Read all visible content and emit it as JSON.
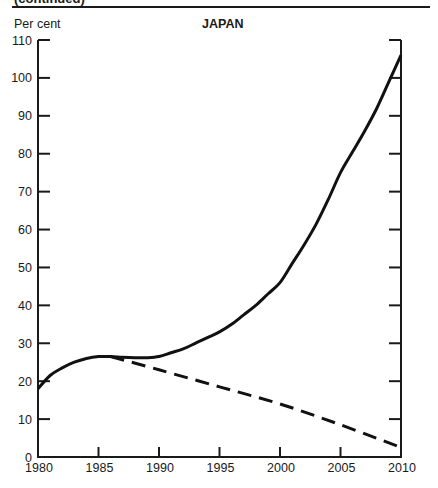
{
  "header": {
    "continued_label": "(continued)",
    "y_unit_label": "Per cent",
    "title": "JAPAN"
  },
  "chart_data": {
    "type": "line",
    "title": "JAPAN",
    "xlabel": "",
    "ylabel": "Per cent",
    "xlim": [
      1980,
      2010
    ],
    "ylim": [
      0,
      110
    ],
    "x_ticks": [
      1980,
      1985,
      1990,
      1995,
      2000,
      2005,
      2010
    ],
    "y_ticks": [
      0,
      10,
      20,
      30,
      40,
      50,
      60,
      70,
      80,
      90,
      100,
      110
    ],
    "grid": false,
    "legend": null,
    "series": [
      {
        "name": "solid",
        "style": "solid",
        "x": [
          1980,
          1981,
          1982,
          1983,
          1984,
          1985,
          1986,
          1987,
          1988,
          1989,
          1990,
          1991,
          1992,
          1993,
          1994,
          1995,
          1996,
          1997,
          1998,
          1999,
          2000,
          2001,
          2002,
          2003,
          2004,
          2005,
          2006,
          2007,
          2008,
          2009,
          2010
        ],
        "values": [
          18,
          21.5,
          23.5,
          25,
          26,
          26.5,
          26.5,
          26.3,
          26.2,
          26.2,
          26.5,
          27.5,
          28.5,
          30,
          31.5,
          33,
          35,
          37.5,
          40,
          43,
          46,
          51,
          56,
          61.5,
          68,
          75,
          80.5,
          86,
          92,
          99,
          106
        ]
      },
      {
        "name": "dashed",
        "style": "dashed",
        "x": [
          1986,
          1990,
          1995,
          2000,
          2005,
          2010
        ],
        "values": [
          26.5,
          23,
          18.5,
          14,
          8.5,
          2.5
        ]
      }
    ]
  }
}
